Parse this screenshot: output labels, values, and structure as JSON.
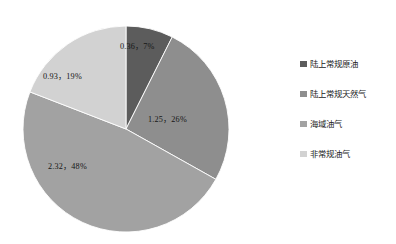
{
  "chart_data": {
    "type": "pie",
    "title": "",
    "legend_position": "right",
    "grid": false,
    "total": 4.86,
    "categories": [
      "陆上常规原油",
      "陆上常规天然气",
      "海域油气",
      "非常规油气"
    ],
    "values": [
      0.36,
      1.25,
      2.32,
      0.93
    ],
    "percents": [
      7,
      26,
      48,
      19
    ],
    "data_labels": [
      "0.36，7%",
      "1.25，26%",
      "2.32，48%",
      "0.93，19%"
    ],
    "colors": [
      "#5c5c5c",
      "#8e8e8e",
      "#a2a2a2",
      "#d2d2d2"
    ],
    "start_angle_deg": 0,
    "direction": "clockwise"
  },
  "pie": {
    "labels": [
      {
        "text": "0.36，7%",
        "x": 120,
        "y": 39
      },
      {
        "text": "1.25，26%",
        "x": 148,
        "y": 112
      },
      {
        "text": "2.32，48%",
        "x": 48,
        "y": 159
      },
      {
        "text": "0.93，19%",
        "x": 43,
        "y": 69
      }
    ]
  },
  "legend": {
    "items": [
      {
        "label": "陆上常规原油",
        "color": "#5c5c5c"
      },
      {
        "label": "陆上常规天然气",
        "color": "#8e8e8e"
      },
      {
        "label": "海域油气",
        "color": "#a2a2a2"
      },
      {
        "label": "非常规油气",
        "color": "#d2d2d2"
      }
    ]
  },
  "geometry": {
    "cx": 126,
    "cy": 129,
    "r": 103
  }
}
